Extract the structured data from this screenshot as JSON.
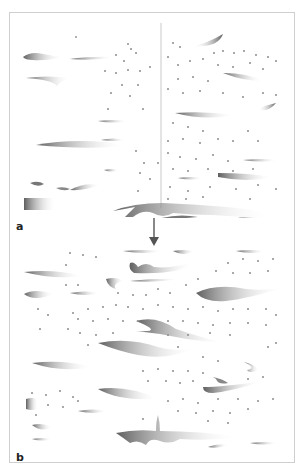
{
  "figure": {
    "panels": [
      {
        "id": "a",
        "label": "a"
      },
      {
        "id": "b",
        "label": "b"
      }
    ],
    "arrow": {
      "direction": "down",
      "from": "a",
      "to": "b"
    },
    "colors": {
      "border": "#cfcfcf",
      "streak_dark": "#6e6e6e",
      "streak_light": "#ffffff",
      "dot": "#9a9a9a",
      "label": "#222222"
    }
  }
}
